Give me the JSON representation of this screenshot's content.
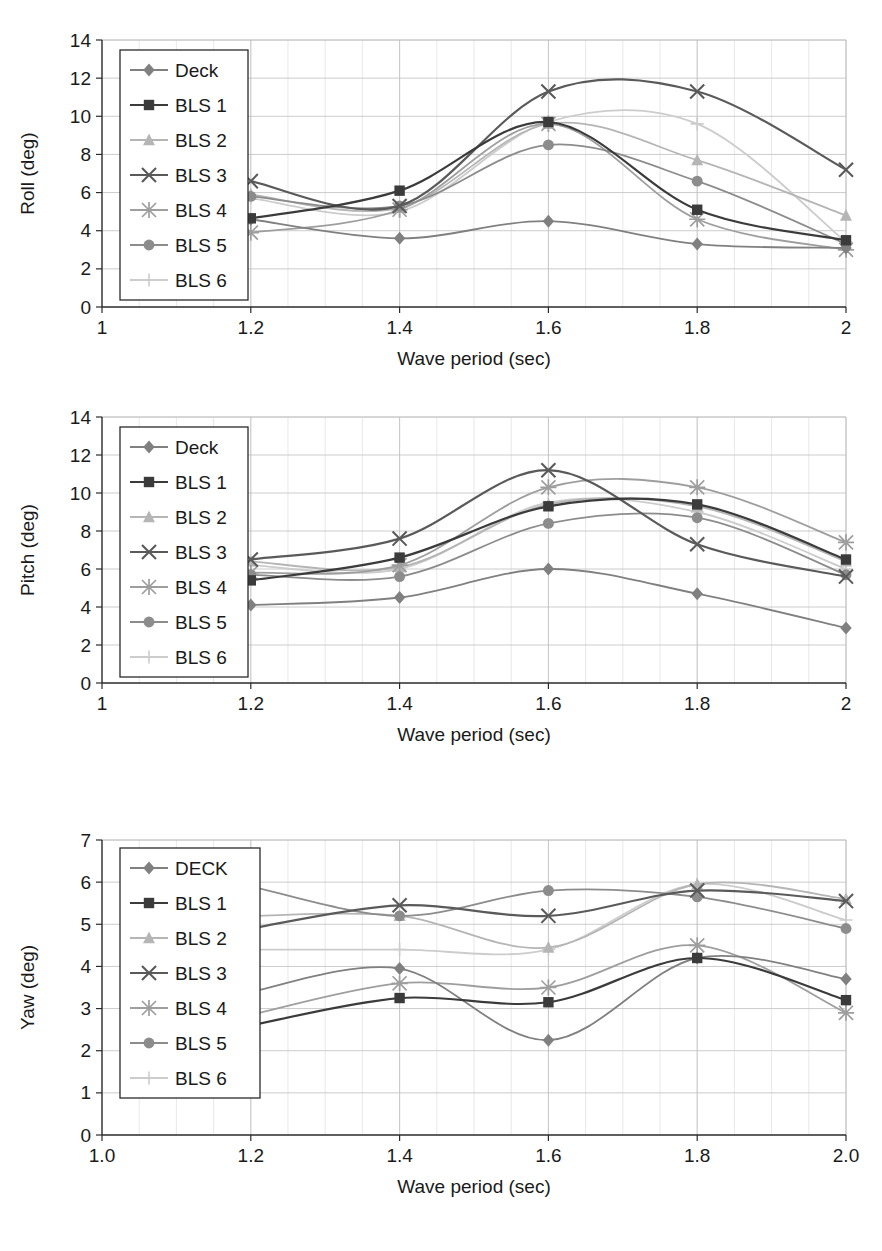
{
  "figure": {
    "background": "#ffffff",
    "series_colors": {
      "Deck": "#808080",
      "BLS 1": "#3b3b3b",
      "BLS 2": "#b5b5b5",
      "BLS 3": "#5a5a5a",
      "BLS 4": "#9e9e9e",
      "BLS 5": "#8c8c8c",
      "BLS 6": "#cccccc"
    },
    "markers": {
      "Deck": "diamond",
      "BLS 1": "square",
      "BLS 2": "triangle",
      "BLS 3": "cross",
      "BLS 4": "asterisk",
      "BLS 5": "circle",
      "BLS 6": "plus"
    }
  },
  "charts": [
    {
      "id": "roll",
      "ylabel": "Roll (deg)",
      "xlabel": "Wave period (sec)"
    },
    {
      "id": "pitch",
      "ylabel": "Pitch (deg)",
      "xlabel": "Wave period (sec)"
    },
    {
      "id": "yaw",
      "ylabel": "Yaw (deg)",
      "xlabel": "Wave period (sec)"
    }
  ],
  "chart_data": [
    {
      "type": "line",
      "id": "roll",
      "title": "",
      "xlabel": "Wave period (sec)",
      "ylabel": "Roll (deg)",
      "x": [
        1.2,
        1.4,
        1.6,
        1.8,
        2.0
      ],
      "xlim": [
        1,
        2
      ],
      "ylim": [
        0,
        14
      ],
      "xticks": [
        1,
        1.2,
        1.4,
        1.6,
        1.8,
        2
      ],
      "xticklabels": [
        "1",
        "1.2",
        "1.4",
        "1.6",
        "1.8",
        "2"
      ],
      "yticks": [
        0,
        2,
        4,
        6,
        8,
        10,
        12,
        14
      ],
      "yticklabels": [
        "0",
        "2",
        "4",
        "6",
        "8",
        "10",
        "12",
        "14"
      ],
      "grid": true,
      "legend_position": "upper-left",
      "series": [
        {
          "name": "Deck",
          "values": [
            4.6,
            3.6,
            4.5,
            3.3,
            3.1
          ]
        },
        {
          "name": "BLS 1",
          "values": [
            4.65,
            6.1,
            9.7,
            5.1,
            3.5
          ]
        },
        {
          "name": "BLS 2",
          "values": [
            5.9,
            5.2,
            9.6,
            7.7,
            4.8
          ]
        },
        {
          "name": "BLS 3",
          "values": [
            6.6,
            5.3,
            11.3,
            11.3,
            7.2
          ]
        },
        {
          "name": "BLS 4",
          "values": [
            3.9,
            5.1,
            9.6,
            4.6,
            3.0
          ]
        },
        {
          "name": "BLS 5",
          "values": [
            5.8,
            5.3,
            8.5,
            6.6,
            3.3
          ]
        },
        {
          "name": "BLS 6",
          "values": [
            5.7,
            5.0,
            9.7,
            9.6,
            3.4
          ]
        }
      ]
    },
    {
      "type": "line",
      "id": "pitch",
      "title": "",
      "xlabel": "Wave period (sec)",
      "ylabel": "Pitch (deg)",
      "x": [
        1.2,
        1.4,
        1.6,
        1.8,
        2.0
      ],
      "xlim": [
        1,
        2
      ],
      "ylim": [
        0,
        14
      ],
      "xticks": [
        1,
        1.2,
        1.4,
        1.6,
        1.8,
        2
      ],
      "xticklabels": [
        "1",
        "1.2",
        "1.4",
        "1.6",
        "1.8",
        "2"
      ],
      "yticks": [
        0,
        2,
        4,
        6,
        8,
        10,
        12,
        14
      ],
      "yticklabels": [
        "0",
        "2",
        "4",
        "6",
        "8",
        "10",
        "12",
        "14"
      ],
      "grid": true,
      "legend_position": "upper-left",
      "series": [
        {
          "name": "Deck",
          "values": [
            4.1,
            4.5,
            6.0,
            4.7,
            2.9
          ]
        },
        {
          "name": "BLS 1",
          "values": [
            5.4,
            6.6,
            9.3,
            9.4,
            6.5
          ]
        },
        {
          "name": "BLS 2",
          "values": [
            6.4,
            6.1,
            9.4,
            9.3,
            6.4
          ]
        },
        {
          "name": "BLS 3",
          "values": [
            6.5,
            7.6,
            11.2,
            7.3,
            5.6
          ]
        },
        {
          "name": "BLS 4",
          "values": [
            5.8,
            6.2,
            10.3,
            10.3,
            7.4
          ]
        },
        {
          "name": "BLS 5",
          "values": [
            5.7,
            5.6,
            8.4,
            8.7,
            5.7
          ]
        },
        {
          "name": "BLS 6",
          "values": [
            6.2,
            6.0,
            9.5,
            9.0,
            6.0
          ]
        }
      ]
    },
    {
      "type": "line",
      "id": "yaw",
      "title": "",
      "xlabel": "Wave period (sec)",
      "ylabel": "Yaw (deg)",
      "x": [
        1.2,
        1.4,
        1.6,
        1.8,
        2.0
      ],
      "xlim": [
        1.0,
        2.0
      ],
      "ylim": [
        0,
        7
      ],
      "xticks": [
        1.0,
        1.2,
        1.4,
        1.6,
        1.8,
        2.0
      ],
      "xticklabels": [
        "1.0",
        "1.2",
        "1.4",
        "1.6",
        "1.8",
        "2.0"
      ],
      "yticks": [
        0,
        1,
        2,
        3,
        4,
        5,
        6,
        7
      ],
      "yticklabels": [
        "0",
        "1",
        "2",
        "3",
        "4",
        "5",
        "6",
        "7"
      ],
      "grid": true,
      "legend_position": "upper-left",
      "series": [
        {
          "name": "DECK",
          "values": [
            3.4,
            3.95,
            2.25,
            4.2,
            3.7
          ]
        },
        {
          "name": "BLS 1",
          "values": [
            2.6,
            3.25,
            3.15,
            4.2,
            3.2
          ]
        },
        {
          "name": "BLS 2",
          "values": [
            5.2,
            5.2,
            4.45,
            5.95,
            5.6
          ]
        },
        {
          "name": "BLS 3",
          "values": [
            4.9,
            5.45,
            5.2,
            5.8,
            5.55
          ]
        },
        {
          "name": "BLS 4",
          "values": [
            2.85,
            3.6,
            3.5,
            4.5,
            2.9
          ]
        },
        {
          "name": "BLS 5",
          "values": [
            5.9,
            5.2,
            5.8,
            5.65,
            4.9
          ]
        },
        {
          "name": "BLS 6",
          "values": [
            4.4,
            4.4,
            4.4,
            5.95,
            5.1
          ]
        }
      ]
    }
  ],
  "legends": [
    {
      "chart": "roll",
      "items": [
        {
          "label": "Deck"
        },
        {
          "label": "BLS 1"
        },
        {
          "label": "BLS 2"
        },
        {
          "label": "BLS 3"
        },
        {
          "label": "BLS 4"
        },
        {
          "label": "BLS 5"
        },
        {
          "label": "BLS 6"
        }
      ]
    },
    {
      "chart": "pitch",
      "items": [
        {
          "label": "Deck"
        },
        {
          "label": "BLS 1"
        },
        {
          "label": "BLS 2"
        },
        {
          "label": "BLS 3"
        },
        {
          "label": "BLS 4"
        },
        {
          "label": "BLS 5"
        },
        {
          "label": "BLS 6"
        }
      ]
    },
    {
      "chart": "yaw",
      "items": [
        {
          "label": "DECK"
        },
        {
          "label": "BLS 1"
        },
        {
          "label": "BLS 2"
        },
        {
          "label": "BLS 3"
        },
        {
          "label": "BLS 4"
        },
        {
          "label": "BLS 5"
        },
        {
          "label": "BLS 6"
        }
      ]
    }
  ]
}
